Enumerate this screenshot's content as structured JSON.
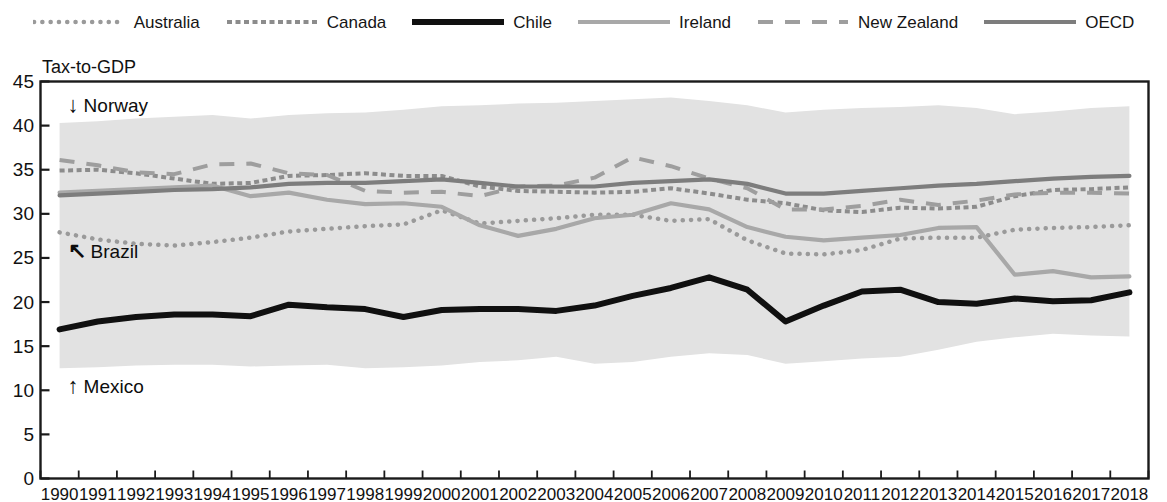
{
  "figure": {
    "axis_title": "Tax-to-GDP",
    "background": "#ffffff",
    "plot_border_color": "#1a1a1a",
    "band_color": "#e2e2e2"
  },
  "legend": {
    "position": "top-center",
    "items": [
      {
        "label": "Australia",
        "color": "#9a9a9a",
        "style": "dotted",
        "key": "australia"
      },
      {
        "label": "Canada",
        "color": "#8c8c8c",
        "style": "fine-dash",
        "key": "canada"
      },
      {
        "label": "Chile",
        "color": "#101010",
        "style": "solid-thick",
        "key": "chile"
      },
      {
        "label": "Ireland",
        "color": "#a8a8a8",
        "style": "solid",
        "key": "ireland"
      },
      {
        "label": "New Zealand",
        "color": "#9e9e9e",
        "style": "dashed",
        "key": "newzealand"
      },
      {
        "label": "OECD",
        "color": "#7d7d7d",
        "style": "solid",
        "key": "oecd"
      }
    ]
  },
  "annotations": [
    {
      "text": "Norway",
      "arrow": "up",
      "glyph": "↓",
      "x_value": 1990.3,
      "y_value": 42.2,
      "key": "norway"
    },
    {
      "text": "Brazil",
      "arrow": "nw",
      "glyph": "↖",
      "x_value": 1990.3,
      "y_value": 25.7,
      "key": "brazil"
    },
    {
      "text": "Mexico",
      "arrow": "down",
      "glyph": "↑",
      "x_value": 1990.3,
      "y_value": 10.4,
      "key": "mexico"
    }
  ],
  "chart_data": {
    "type": "line",
    "title": "Tax-to-GDP",
    "xlabel": "",
    "ylabel": "Tax-to-GDP",
    "ylim": [
      0,
      45
    ],
    "ytick_values": [
      0,
      5,
      10,
      15,
      20,
      25,
      30,
      35,
      40,
      45
    ],
    "ytick_labels": [
      "0",
      "5",
      "10",
      "15",
      "20",
      "25",
      "30",
      "35",
      "40",
      "45"
    ],
    "grid": false,
    "legend_position": "top-center",
    "x": [
      1990,
      1991,
      1992,
      1993,
      1994,
      1995,
      1996,
      1997,
      1998,
      1999,
      2000,
      2001,
      2002,
      2003,
      2004,
      2005,
      2006,
      2007,
      2008,
      2009,
      2010,
      2011,
      2012,
      2013,
      2014,
      2015,
      2016,
      2017,
      2018
    ],
    "xtick_labels": [
      "1990",
      "1991",
      "1992",
      "1993",
      "1994",
      "1995",
      "1996",
      "1997",
      "1998",
      "1999",
      "2000",
      "2001",
      "2002",
      "2003",
      "2004",
      "2005",
      "2006",
      "2007",
      "2008",
      "2009",
      "2010",
      "2011",
      "2012",
      "2013",
      "2014",
      "2015",
      "2016",
      "2017",
      "2018"
    ],
    "band": {
      "name": "OECD range (Mexico to Norway)",
      "upper_label": "Norway",
      "lower_label": "Mexico",
      "upper": [
        40.3,
        40.5,
        40.8,
        41.0,
        41.2,
        40.8,
        41.2,
        41.4,
        41.5,
        41.8,
        42.2,
        42.3,
        42.5,
        42.6,
        42.8,
        43.0,
        43.2,
        42.8,
        42.3,
        41.5,
        41.8,
        42.0,
        42.1,
        42.3,
        42.0,
        41.3,
        41.6,
        42.0,
        42.2
      ],
      "lower": [
        12.5,
        12.6,
        12.8,
        12.9,
        12.9,
        12.7,
        12.8,
        12.9,
        12.5,
        12.6,
        12.8,
        13.2,
        13.4,
        13.8,
        13.0,
        13.2,
        13.8,
        14.2,
        14.0,
        13.0,
        13.3,
        13.6,
        13.8,
        14.6,
        15.5,
        16.0,
        16.4,
        16.2,
        16.1
      ]
    },
    "series": [
      {
        "name": "Australia",
        "color": "#9a9a9a",
        "style": "dotted",
        "values": [
          27.9,
          27.1,
          26.6,
          26.4,
          26.8,
          27.3,
          28.0,
          28.3,
          28.6,
          28.8,
          30.4,
          28.9,
          29.2,
          29.5,
          29.9,
          29.9,
          29.2,
          29.4,
          27.0,
          25.5,
          25.4,
          25.9,
          27.2,
          27.3,
          27.3,
          28.2,
          28.4,
          28.5,
          28.7
        ]
      },
      {
        "name": "Canada",
        "color": "#8c8c8c",
        "style": "fine-dash",
        "values": [
          34.9,
          35.0,
          34.6,
          34.0,
          33.4,
          33.5,
          34.3,
          34.4,
          34.6,
          34.3,
          34.3,
          33.1,
          32.6,
          32.5,
          32.4,
          32.5,
          32.9,
          32.3,
          31.6,
          31.2,
          30.4,
          30.2,
          30.7,
          30.6,
          30.8,
          32.0,
          32.7,
          32.8,
          33.0
        ]
      },
      {
        "name": "Chile",
        "color": "#101010",
        "style": "solid-thick",
        "values": [
          16.9,
          17.8,
          18.3,
          18.6,
          18.6,
          18.4,
          19.7,
          19.4,
          19.2,
          18.3,
          19.1,
          19.2,
          19.2,
          19.0,
          19.6,
          20.7,
          21.6,
          22.8,
          21.4,
          17.8,
          19.6,
          21.2,
          21.4,
          20.0,
          19.8,
          20.4,
          20.1,
          20.2,
          21.1
        ]
      },
      {
        "name": "Ireland",
        "color": "#a8a8a8",
        "style": "solid",
        "values": [
          32.4,
          32.6,
          32.8,
          33.0,
          33.2,
          32.0,
          32.4,
          31.6,
          31.1,
          31.2,
          30.8,
          28.7,
          27.5,
          28.3,
          29.5,
          29.9,
          31.2,
          30.5,
          28.5,
          27.4,
          27.0,
          27.3,
          27.6,
          28.4,
          28.5,
          23.1,
          23.5,
          22.8,
          22.9
        ]
      },
      {
        "name": "New Zealand",
        "color": "#9e9e9e",
        "style": "dashed",
        "values": [
          36.1,
          35.5,
          34.7,
          34.5,
          35.6,
          35.7,
          34.6,
          34.4,
          32.6,
          32.4,
          32.5,
          32.0,
          33.1,
          33.2,
          34.1,
          36.4,
          35.4,
          34.0,
          32.9,
          30.5,
          30.5,
          30.9,
          31.6,
          31.0,
          31.5,
          32.2,
          32.4,
          32.4,
          32.3
        ]
      },
      {
        "name": "OECD",
        "color": "#7d7d7d",
        "style": "solid",
        "values": [
          32.1,
          32.3,
          32.5,
          32.7,
          32.8,
          33.0,
          33.4,
          33.5,
          33.5,
          33.7,
          33.9,
          33.5,
          33.1,
          33.1,
          33.1,
          33.5,
          33.7,
          33.9,
          33.4,
          32.3,
          32.3,
          32.6,
          32.9,
          33.2,
          33.4,
          33.7,
          34.0,
          34.2,
          34.3
        ]
      }
    ]
  }
}
